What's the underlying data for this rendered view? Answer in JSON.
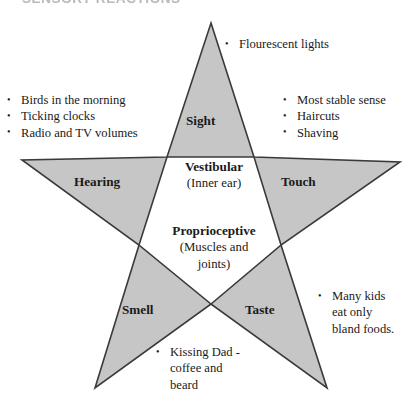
{
  "page": {
    "title": "SENSORY REACTIONS",
    "background_color": "#ffffff",
    "star_fill_color": "#c6c6c6",
    "star_stroke_color": "#3a3a3a"
  },
  "diagram": {
    "type": "five-pointed-star",
    "points": [
      {
        "id": "sight",
        "label": "Sight",
        "position": "top",
        "bullets": [
          "Flourescent lights"
        ]
      },
      {
        "id": "hearing",
        "label": "Hearing",
        "position": "left",
        "bullets": [
          "Birds in the morning",
          "Ticking clocks",
          "Radio and TV volumes"
        ]
      },
      {
        "id": "touch",
        "label": "Touch",
        "position": "right",
        "bullets": [
          "Most stable sense",
          "Haircuts",
          "Shaving"
        ]
      },
      {
        "id": "smell",
        "label": "Smell",
        "position": "bottom-left",
        "bullets": [
          "Kissing Dad - coffee and beard"
        ]
      },
      {
        "id": "taste",
        "label": "Taste",
        "position": "bottom-right",
        "bullets": [
          "Many kids eat only bland foods."
        ]
      }
    ],
    "center": [
      {
        "id": "vestibular",
        "head": "Vestibular",
        "sub": "(Inner ear)"
      },
      {
        "id": "proprioceptive",
        "head": "Proprioceptive",
        "sub_line1": "(Muscles and",
        "sub_line2": "joints)"
      }
    ]
  },
  "bullet_text": {
    "sight_1": "Flourescent lights",
    "hearing_1": "Birds in the morning",
    "hearing_2": "Ticking clocks",
    "hearing_3": "Radio and TV volumes",
    "touch_1": "Most stable sense",
    "touch_2": "Haircuts",
    "touch_3": "Shaving",
    "smell_1_line1": "Kissing Dad -",
    "smell_1_line2": "coffee and",
    "smell_1_line3": "beard",
    "taste_1_line1": "Many kids",
    "taste_1_line2": "eat only",
    "taste_1_line3": "bland foods."
  }
}
